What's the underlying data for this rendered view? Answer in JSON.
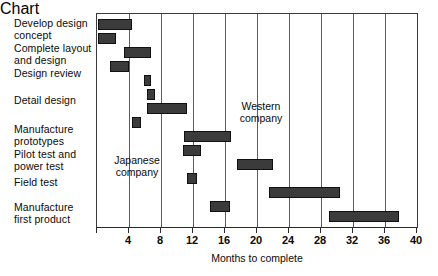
{
  "chart_data": {
    "type": "bar",
    "chart_style": "gantt",
    "title": "",
    "xlabel": "Months to complete",
    "ylabel": "",
    "xlim": [
      0,
      40
    ],
    "xticks": [
      0,
      4,
      8,
      12,
      16,
      20,
      24,
      28,
      32,
      36,
      40
    ],
    "xticklabels": [
      "",
      "4",
      "8",
      "12",
      "16",
      "20",
      "24",
      "28",
      "32",
      "36",
      "40"
    ],
    "grid": "vertical",
    "legend": "none",
    "bar_color": "#3b3b3b",
    "tasks": [
      "Develop design concept",
      "Complete layout and design",
      "Design review",
      "Detail design",
      "Manufacture prototypes",
      "Pilot test and power test",
      "Field test",
      "Manufacture first product"
    ],
    "series": [
      {
        "name": "Japanese company",
        "bars": [
          {
            "task": "Develop design concept",
            "start": 0.0,
            "end": 4.3
          },
          {
            "task": "Complete layout and design",
            "start": 3.4,
            "end": 6.7
          },
          {
            "task": "Design review",
            "start": 1.7,
            "end": 4.0
          },
          {
            "task": "Detail design",
            "start": 6.3,
            "end": 7.2
          },
          {
            "task": "Manufacture prototypes",
            "start": 4.4,
            "end": 5.5
          },
          {
            "task": "Pilot test and power test",
            "start": 10.8,
            "end": 13.0
          },
          {
            "task": "Field test",
            "start": 11.2,
            "end": 12.4
          },
          {
            "task": "Manufacture first product",
            "start": 14.0,
            "end": 16.5
          }
        ]
      },
      {
        "name": "Western company",
        "bars": [
          {
            "task": "Develop design concept",
            "start": 0.0,
            "end": 2.3
          },
          {
            "task": "Design review",
            "start": 5.9,
            "end": 6.7
          },
          {
            "task": "Detail design",
            "start": 6.3,
            "end": 11.3
          },
          {
            "task": "Manufacture prototypes",
            "start": 10.8,
            "end": 16.7
          },
          {
            "task": "Pilot test and power test",
            "start": 17.4,
            "end": 21.9
          },
          {
            "task": "Field test",
            "start": 21.4,
            "end": 30.2
          },
          {
            "task": "Manufacture first product",
            "start": 28.8,
            "end": 37.5
          }
        ]
      }
    ],
    "annotations": [
      {
        "text": "Japanese company",
        "x": 4.2,
        "y_row": 6
      },
      {
        "text": "Western company",
        "x": 20.0,
        "y_row": 4
      }
    ]
  },
  "labels": {
    "tasks": [
      {
        "text": "Develop design\nconcept",
        "top": 18
      },
      {
        "text": "Complete layout\nand design",
        "top": 43
      },
      {
        "text": "Design review",
        "top": 68
      },
      {
        "text": "Detail design",
        "top": 95
      },
      {
        "text": "Manufacture\nprototypes",
        "top": 124
      },
      {
        "text": "Pilot test and\npower test",
        "top": 149
      },
      {
        "text": "Field test",
        "top": 177
      },
      {
        "text": "Manufacture\nfirst product",
        "top": 202
      }
    ]
  },
  "annotations": {
    "japanese": "Japanese\ncompany",
    "western": "Western\ncompany"
  },
  "axis": {
    "title": "Months to complete",
    "ticks": [
      "",
      "4",
      "8",
      "12",
      "16",
      "20",
      "24",
      "28",
      "32",
      "36",
      "40"
    ]
  },
  "bars_px": [
    {
      "name": "develop-design-concept-japanese",
      "left": 1,
      "width": 34,
      "top": 5
    },
    {
      "name": "develop-design-concept-western",
      "left": 1,
      "width": 18,
      "top": 19
    },
    {
      "name": "complete-layout-and-design-japanese",
      "left": 27,
      "width": 27,
      "top": 33
    },
    {
      "name": "design-review-japanese",
      "left": 13,
      "width": 19,
      "top": 47
    },
    {
      "name": "design-review-western",
      "left": 47,
      "width": 7,
      "top": 61
    },
    {
      "name": "detail-design-japanese",
      "left": 50,
      "width": 8,
      "top": 75
    },
    {
      "name": "detail-design-western",
      "left": 50,
      "width": 40,
      "top": 89
    },
    {
      "name": "manufacture-prototypes-japanese",
      "left": 35,
      "width": 9,
      "top": 103
    },
    {
      "name": "manufacture-prototypes-western",
      "left": 87,
      "width": 47,
      "top": 117
    },
    {
      "name": "pilot-test-japanese",
      "left": 86,
      "width": 18,
      "top": 131
    },
    {
      "name": "pilot-test-western",
      "left": 140,
      "width": 36,
      "top": 145
    },
    {
      "name": "field-test-japanese",
      "left": 90,
      "width": 10,
      "top": 159
    },
    {
      "name": "field-test-western",
      "left": 172,
      "width": 71,
      "top": 173
    },
    {
      "name": "manufacture-first-product-japanese",
      "left": 113,
      "width": 20,
      "top": 187
    },
    {
      "name": "manufacture-first-product-western",
      "left": 232,
      "width": 70,
      "top": 197
    }
  ]
}
